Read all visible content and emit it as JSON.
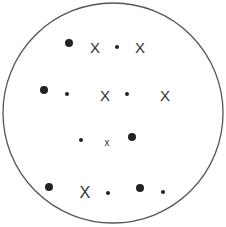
{
  "diagram": {
    "type": "particle-container",
    "container": {
      "shape": "circle",
      "cx": 113,
      "cy": 113,
      "r": 110,
      "stroke": "#555555",
      "stroke_width": 1.3
    },
    "colors": {
      "particle": "#222222",
      "cross": "#333333",
      "background": "#ffffff"
    },
    "legend_symbols": {
      "large_dot": "large filled circle",
      "small_dot": "small filled circle",
      "cross": "X symbol"
    },
    "particles": [
      {
        "kind": "large_dot",
        "x": 69,
        "y": 43
      },
      {
        "kind": "cross",
        "label": "X",
        "x": 95,
        "y": 48,
        "size": 12
      },
      {
        "kind": "small_dot",
        "x": 117,
        "y": 47
      },
      {
        "kind": "cross",
        "label": "X",
        "x": 140,
        "y": 48,
        "size": 12
      },
      {
        "kind": "large_dot",
        "x": 44,
        "y": 90
      },
      {
        "kind": "small_dot",
        "x": 67,
        "y": 94
      },
      {
        "kind": "cross",
        "label": "X",
        "x": 105,
        "y": 96,
        "size": 12
      },
      {
        "kind": "small_dot",
        "x": 127,
        "y": 94
      },
      {
        "kind": "cross",
        "label": "X",
        "x": 165,
        "y": 96,
        "size": 12
      },
      {
        "kind": "small_dot",
        "x": 81,
        "y": 140
      },
      {
        "kind": "cross",
        "label": "x",
        "x": 107,
        "y": 143,
        "size": 8
      },
      {
        "kind": "large_dot",
        "x": 132,
        "y": 137
      },
      {
        "kind": "large_dot",
        "x": 49,
        "y": 187
      },
      {
        "kind": "cross",
        "label": "X",
        "x": 85,
        "y": 193,
        "size": 13
      },
      {
        "kind": "small_dot",
        "x": 108,
        "y": 193
      },
      {
        "kind": "large_dot",
        "x": 140,
        "y": 188
      },
      {
        "kind": "small_dot",
        "x": 163,
        "y": 192
      }
    ]
  }
}
